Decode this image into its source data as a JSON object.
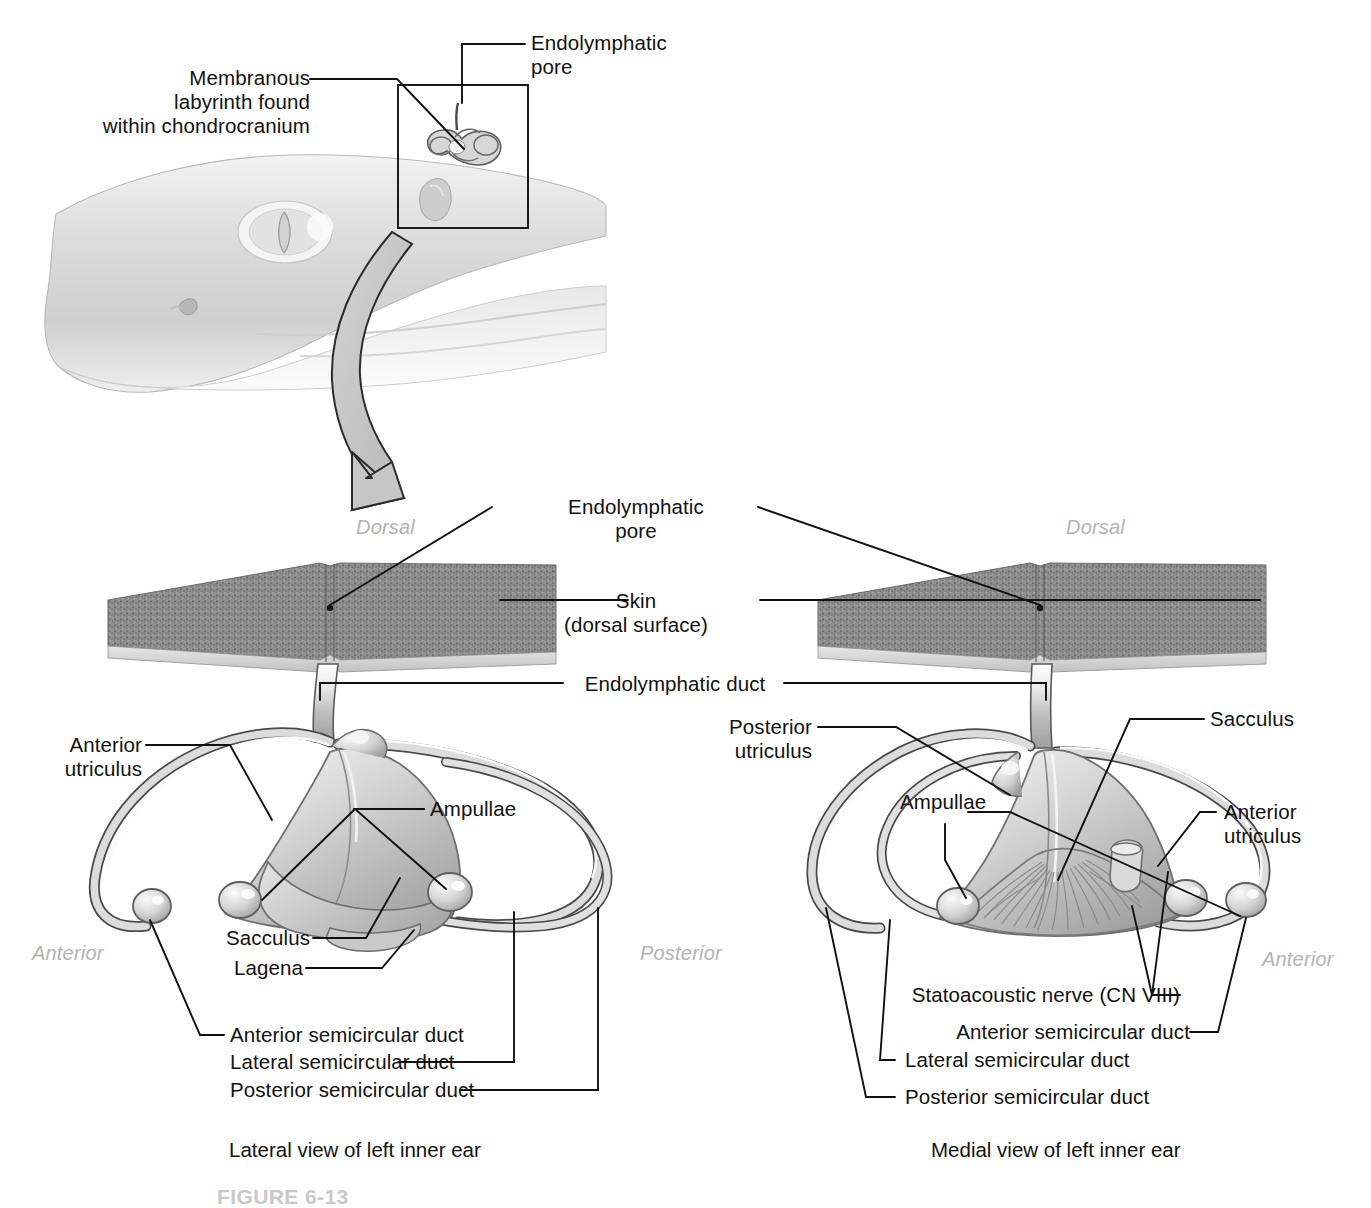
{
  "figure": {
    "caption_partial": "FIGURE 6-13",
    "top_labels": {
      "membranous_labyrinth": "Membranous\nlabyrinth found\nwithin chondrocranium",
      "endolymphatic_pore": "Endolymphatic\npore"
    },
    "center_labels": {
      "endolymphatic_pore": "Endolymphatic\npore",
      "skin": "Skin\n(dorsal surface)",
      "skin_line1": "Skin",
      "skin_line2": "(dorsal surface)",
      "endolymphatic_duct": "Endolymphatic duct"
    },
    "orientation": {
      "dorsal_left": "Dorsal",
      "dorsal_right": "Dorsal",
      "anterior_left": "Anterior",
      "posterior_center": "Posterior",
      "anterior_right": "Anterior"
    },
    "left_panel": {
      "view_caption": "Lateral view of left inner ear",
      "labels": {
        "anterior_utriculus": "Anterior\nutriculus",
        "anterior_utriculus_l1": "Anterior",
        "anterior_utriculus_l2": "utriculus",
        "ampullae": "Ampullae",
        "sacculus": "Sacculus",
        "lagena": "Lagena",
        "anterior_semicircular_duct": "Anterior semicircular duct",
        "lateral_semicircular_duct": "Lateral semicircular duct",
        "posterior_semicircular_duct": "Posterior semicircular duct"
      }
    },
    "right_panel": {
      "view_caption": "Medial view of left inner ear",
      "labels": {
        "posterior_utriculus": "Posterior\nutriculus",
        "posterior_utriculus_l1": "Posterior",
        "posterior_utriculus_l2": "utriculus",
        "ampullae": "Ampullae",
        "sacculus": "Sacculus",
        "anterior_utriculus_l1": "Anterior",
        "anterior_utriculus_l2": "utriculus",
        "statoacoustic_nerve": "Statoacoustic nerve (CN VIII)",
        "anterior_semicircular_duct": "Anterior semicircular duct",
        "lateral_semicircular_duct": "Lateral semicircular duct",
        "posterior_semicircular_duct": "Posterior semicircular duct"
      }
    },
    "colors": {
      "background": "#ffffff",
      "ink": "#111111",
      "orientation_text": "#b3b3b3",
      "skin_patch": "#8a8a8a",
      "skin_patch_dark": "#6f6f6f",
      "duct_fill": "#d8d8d8",
      "organ_light": "#e6e6e6",
      "organ_mid": "#c2c2c2",
      "organ_dark": "#9a9a9a",
      "shark_body": "#d5d5d5",
      "arrow_fill": "#c6c6c6"
    }
  }
}
